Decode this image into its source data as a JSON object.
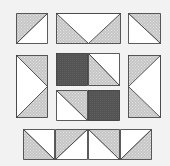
{
  "diagram": {
    "colors": {
      "background": "#f2f2f2",
      "white": "#ffffff",
      "gray": "#c6c6c6",
      "gray_dots": "#e2e2e2",
      "dark": "#545454",
      "outline": "#333333"
    },
    "pieces": [
      {
        "id": "top-left-hst",
        "x": 16,
        "y": 13,
        "w": 32,
        "h": 31,
        "type": "hst",
        "diagonal": "bl-tr",
        "gray_side": "top-left"
      },
      {
        "id": "top-middle-flying-goose",
        "x": 56,
        "y": 13,
        "w": 65,
        "h": 31,
        "type": "goose",
        "point": "down"
      },
      {
        "id": "top-right-hst",
        "x": 128,
        "y": 13,
        "w": 33,
        "h": 31,
        "type": "hst",
        "diagonal": "tl-br",
        "gray_side": "top-right"
      },
      {
        "id": "left-middle-flying-goose",
        "x": 16,
        "y": 55,
        "w": 32,
        "h": 63,
        "type": "goose",
        "point": "right"
      },
      {
        "id": "center-dark-square-top",
        "x": 56,
        "y": 53,
        "w": 32,
        "h": 33,
        "type": "solid"
      },
      {
        "id": "center-hst-top",
        "x": 88,
        "y": 53,
        "w": 32,
        "h": 33,
        "type": "hst",
        "diagonal": "tl-br",
        "gray_side": "bottom-left"
      },
      {
        "id": "center-hst-bottom",
        "x": 56,
        "y": 90,
        "w": 32,
        "h": 31,
        "type": "hst",
        "diagonal": "tl-br",
        "gray_side": "top-right"
      },
      {
        "id": "center-dark-square-bottom",
        "x": 88,
        "y": 90,
        "w": 32,
        "h": 31,
        "type": "solid"
      },
      {
        "id": "right-middle-flying-goose",
        "x": 128,
        "y": 55,
        "w": 33,
        "h": 63,
        "type": "goose",
        "point": "left"
      },
      {
        "id": "bottom-hst-1",
        "x": 23,
        "y": 129,
        "w": 32,
        "h": 31,
        "type": "hst",
        "diagonal": "tl-br",
        "gray_side": "bottom-left"
      },
      {
        "id": "bottom-hst-2",
        "x": 55,
        "y": 129,
        "w": 33,
        "h": 31,
        "type": "hst",
        "diagonal": "bl-tr",
        "gray_side": "top-left"
      },
      {
        "id": "bottom-hst-3",
        "x": 88,
        "y": 129,
        "w": 32,
        "h": 31,
        "type": "hst",
        "diagonal": "tl-br",
        "gray_side": "top-right"
      },
      {
        "id": "bottom-hst-4",
        "x": 120,
        "y": 129,
        "w": 32,
        "h": 31,
        "type": "hst",
        "diagonal": "bl-tr",
        "gray_side": "bottom-right"
      }
    ]
  }
}
